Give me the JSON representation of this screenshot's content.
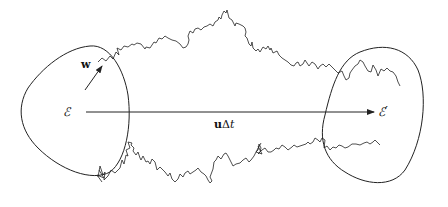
{
  "diagram": {
    "type": "schematic",
    "labels": {
      "left_region": "ℰ",
      "right_region": "ℰ′",
      "velocity_vector": "w",
      "drift_u": "u",
      "drift_delta": "Δ",
      "drift_t": "t"
    },
    "elements": [
      {
        "id": "region-E",
        "shape": "closed-curve",
        "label": "ℰ"
      },
      {
        "id": "region-E-prime",
        "shape": "closed-curve",
        "label": "ℰ′"
      },
      {
        "id": "drift-arrow",
        "from": "ℰ",
        "to": "ℰ′",
        "label": "uΔt"
      },
      {
        "id": "w-arrow",
        "label": "w"
      },
      {
        "id": "brownian-path-top",
        "shape": "random-walk"
      },
      {
        "id": "brownian-path-bottom",
        "shape": "random-walk"
      }
    ],
    "colors": {
      "stroke": "#222222",
      "background": "#ffffff"
    }
  }
}
